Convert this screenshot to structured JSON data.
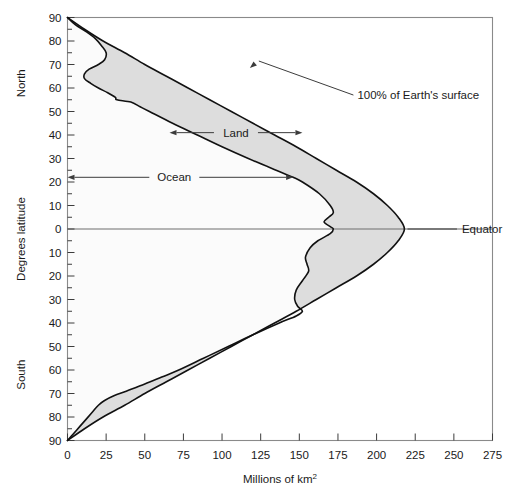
{
  "chart_data": {
    "type": "area",
    "title": "",
    "subtitle": "",
    "xlabel": "Millions of km",
    "xlabel_sup": "2",
    "ylabel": "Degrees latitude",
    "ylabel_north": "North",
    "ylabel_south": "South",
    "xlim": [
      0,
      275
    ],
    "ylim": [
      -90,
      90
    ],
    "xticks": [
      0,
      25,
      50,
      75,
      100,
      125,
      150,
      175,
      200,
      225,
      250,
      275
    ],
    "xtick_labels": [
      "0",
      "25",
      "50",
      "75",
      "100",
      "125",
      "150",
      "175",
      "200",
      "225",
      "250",
      "275"
    ],
    "yticks": [
      90,
      80,
      70,
      60,
      50,
      40,
      30,
      20,
      10,
      0,
      -10,
      -20,
      -30,
      -40,
      -50,
      -60,
      -70,
      -80,
      -90
    ],
    "ytick_labels": [
      "90",
      "80",
      "70",
      "60",
      "50",
      "40",
      "30",
      "20",
      "10",
      "0",
      "10",
      "20",
      "30",
      "40",
      "50",
      "60",
      "70",
      "80",
      "90"
    ],
    "ytick_minor_step": 5,
    "grid": false,
    "legend_position": "none",
    "fill_color": "#dddddd",
    "line_color": "#111111",
    "frame_color": "#8a8a8a",
    "annotations": [
      {
        "name": "total-surface",
        "text": "100% of Earth's surface",
        "x": 185,
        "y": 57
      },
      {
        "name": "land-band",
        "text": "Land",
        "x": 98,
        "y": 41
      },
      {
        "name": "ocean-band",
        "text": "Ocean",
        "x": 62,
        "y": 22
      },
      {
        "name": "equator",
        "text": "Equator",
        "x": 252,
        "y": 0
      }
    ],
    "series": [
      {
        "name": "100% of Earth's surface",
        "description": "Total Earth surface area per latitude band, zero at both poles, maximum at equator",
        "points": [
          {
            "lat": 90,
            "value": 0
          },
          {
            "lat": 85,
            "value": 11
          },
          {
            "lat": 80,
            "value": 23
          },
          {
            "lat": 75,
            "value": 37
          },
          {
            "lat": 70,
            "value": 50
          },
          {
            "lat": 65,
            "value": 64
          },
          {
            "lat": 60,
            "value": 78
          },
          {
            "lat": 55,
            "value": 92
          },
          {
            "lat": 50,
            "value": 106
          },
          {
            "lat": 45,
            "value": 120
          },
          {
            "lat": 40,
            "value": 134
          },
          {
            "lat": 35,
            "value": 148
          },
          {
            "lat": 30,
            "value": 161
          },
          {
            "lat": 25,
            "value": 174
          },
          {
            "lat": 20,
            "value": 187
          },
          {
            "lat": 15,
            "value": 198
          },
          {
            "lat": 10,
            "value": 207
          },
          {
            "lat": 5,
            "value": 214
          },
          {
            "lat": 0,
            "value": 218
          },
          {
            "lat": -5,
            "value": 214
          },
          {
            "lat": -10,
            "value": 207
          },
          {
            "lat": -15,
            "value": 198
          },
          {
            "lat": -20,
            "value": 187
          },
          {
            "lat": -25,
            "value": 174
          },
          {
            "lat": -30,
            "value": 161
          },
          {
            "lat": -35,
            "value": 148
          },
          {
            "lat": -40,
            "value": 134
          },
          {
            "lat": -45,
            "value": 120
          },
          {
            "lat": -50,
            "value": 106
          },
          {
            "lat": -55,
            "value": 92
          },
          {
            "lat": -60,
            "value": 78
          },
          {
            "lat": -65,
            "value": 64
          },
          {
            "lat": -70,
            "value": 50
          },
          {
            "lat": -75,
            "value": 37
          },
          {
            "lat": -80,
            "value": 23
          },
          {
            "lat": -85,
            "value": 11
          },
          {
            "lat": -90,
            "value": 0
          }
        ]
      },
      {
        "name": "Ocean",
        "description": "Cumulative ocean area per latitude; region between y-axis and this curve is ocean, region between this curve and the total curve is land",
        "points": [
          {
            "lat": 90,
            "value": 0
          },
          {
            "lat": 87,
            "value": 5
          },
          {
            "lat": 84,
            "value": 12
          },
          {
            "lat": 81,
            "value": 18
          },
          {
            "lat": 78,
            "value": 22
          },
          {
            "lat": 75,
            "value": 25
          },
          {
            "lat": 72,
            "value": 24
          },
          {
            "lat": 70,
            "value": 20
          },
          {
            "lat": 68,
            "value": 14
          },
          {
            "lat": 66,
            "value": 11
          },
          {
            "lat": 64,
            "value": 11
          },
          {
            "lat": 62,
            "value": 15
          },
          {
            "lat": 60,
            "value": 20
          },
          {
            "lat": 58,
            "value": 26
          },
          {
            "lat": 56,
            "value": 31
          },
          {
            "lat": 55,
            "value": 32
          },
          {
            "lat": 54,
            "value": 41
          },
          {
            "lat": 52,
            "value": 47
          },
          {
            "lat": 50,
            "value": 53
          },
          {
            "lat": 45,
            "value": 68
          },
          {
            "lat": 40,
            "value": 84
          },
          {
            "lat": 35,
            "value": 100
          },
          {
            "lat": 30,
            "value": 117
          },
          {
            "lat": 25,
            "value": 135
          },
          {
            "lat": 22,
            "value": 146
          },
          {
            "lat": 20,
            "value": 152
          },
          {
            "lat": 15,
            "value": 163
          },
          {
            "lat": 10,
            "value": 170
          },
          {
            "lat": 7,
            "value": 172
          },
          {
            "lat": 5,
            "value": 169
          },
          {
            "lat": 3,
            "value": 166
          },
          {
            "lat": 1,
            "value": 170
          },
          {
            "lat": 0,
            "value": 172
          },
          {
            "lat": -2,
            "value": 170
          },
          {
            "lat": -5,
            "value": 162
          },
          {
            "lat": -8,
            "value": 157
          },
          {
            "lat": -12,
            "value": 154
          },
          {
            "lat": -15,
            "value": 155
          },
          {
            "lat": -18,
            "value": 156
          },
          {
            "lat": -22,
            "value": 152
          },
          {
            "lat": -26,
            "value": 148
          },
          {
            "lat": -30,
            "value": 147
          },
          {
            "lat": -33,
            "value": 149
          },
          {
            "lat": -35,
            "value": 152
          },
          {
            "lat": -37,
            "value": 148
          },
          {
            "lat": -40,
            "value": 137
          },
          {
            "lat": -45,
            "value": 120
          },
          {
            "lat": -50,
            "value": 104
          },
          {
            "lat": -55,
            "value": 88
          },
          {
            "lat": -60,
            "value": 72
          },
          {
            "lat": -63,
            "value": 61
          },
          {
            "lat": -66,
            "value": 50
          },
          {
            "lat": -69,
            "value": 38
          },
          {
            "lat": -71,
            "value": 30
          },
          {
            "lat": -73,
            "value": 24
          },
          {
            "lat": -75,
            "value": 20
          },
          {
            "lat": -78,
            "value": 16
          },
          {
            "lat": -81,
            "value": 12
          },
          {
            "lat": -84,
            "value": 8
          },
          {
            "lat": -87,
            "value": 4
          },
          {
            "lat": -90,
            "value": 0
          }
        ]
      }
    ]
  }
}
